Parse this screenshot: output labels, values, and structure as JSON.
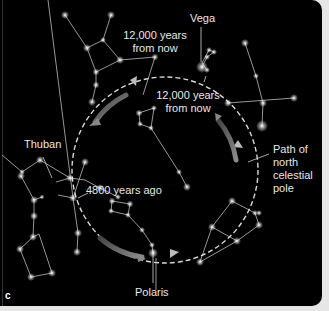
{
  "figure": {
    "panel_letter": "c",
    "background_color": "#000000",
    "labels": {
      "vega": "Vega",
      "future_top_line1": "12,000 years",
      "future_top_line2": "from now",
      "future_mid_line1": "12,000 years",
      "future_mid_line2": "from now",
      "thuban": "Thuban",
      "past": "4800 years ago",
      "polaris": "Polaris",
      "path_line1": "Path of",
      "path_line2": "north",
      "path_line3": "celestial",
      "path_line4": "pole"
    },
    "colors": {
      "star": "#ffffff",
      "constellation_line": "#bdbdbd",
      "path_dashed": "#d9d9d9",
      "direction_arrow": "#7a7a7a",
      "text": "#e8e8e8"
    }
  }
}
